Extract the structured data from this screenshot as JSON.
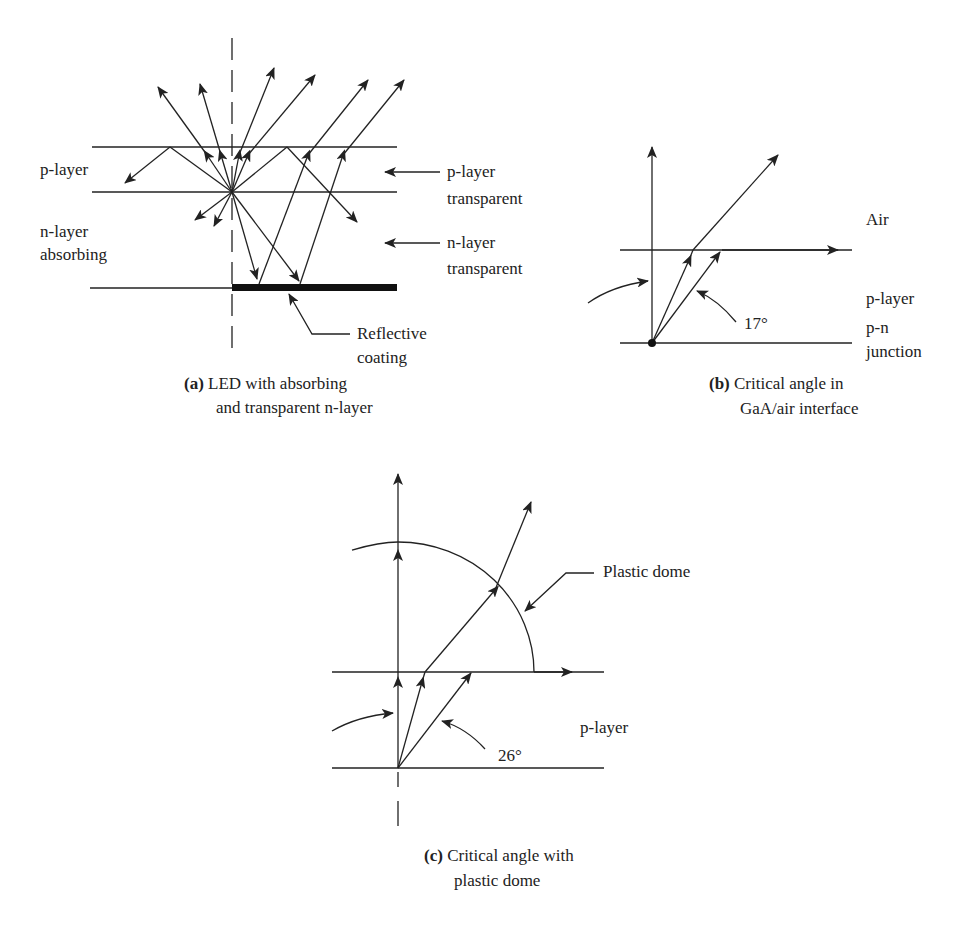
{
  "panel_a": {
    "labels": {
      "p_layer": "p-layer",
      "n_layer_line1": "n-layer",
      "n_layer_line2": "absorbing",
      "p_transparent_line1": "p-layer",
      "p_transparent_line2": "transparent",
      "n_transparent_line1": "n-layer",
      "n_transparent_line2": "transparent",
      "reflective_line1": "Reflective",
      "reflective_line2": "coating"
    },
    "caption": {
      "tag": "(a)",
      "line1": "LED with absorbing",
      "line2": "and transparent n-layer"
    }
  },
  "panel_b": {
    "labels": {
      "air": "Air",
      "p_layer": "p-layer",
      "pn_line1": "p-n",
      "pn_line2": "junction",
      "angle": "17°"
    },
    "caption": {
      "tag": "(b)",
      "line1": "Critical angle in",
      "line2": "GaA/air interface"
    }
  },
  "panel_c": {
    "labels": {
      "plastic_dome": "Plastic dome",
      "p_layer": "p-layer",
      "angle": "26°"
    },
    "caption": {
      "tag": "(c)",
      "line1": "Critical angle with",
      "line2": "plastic dome"
    }
  },
  "colors": {
    "line": "#222222",
    "background": "#ffffff"
  }
}
